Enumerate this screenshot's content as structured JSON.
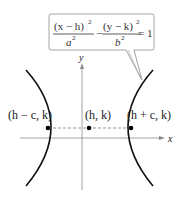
{
  "diagram": {
    "type": "hyperbola",
    "equation": {
      "left_numerator": "(x − h)",
      "left_exp": "2",
      "left_denominator": "a",
      "left_den_exp": "2",
      "operator": "−",
      "right_numerator": "(y − k)",
      "right_exp": "2",
      "right_denominator": "b",
      "right_den_exp": "2",
      "rhs": "= 1"
    },
    "axes": {
      "x_label": "x",
      "y_label": "y"
    },
    "points": [
      {
        "label": "(h − c, k)",
        "role": "left-focus"
      },
      {
        "label": "(h, k)",
        "role": "center"
      },
      {
        "label": "(h + c, k)",
        "role": "right-focus"
      }
    ],
    "colors": {
      "curve": "#111111",
      "axis": "#888888",
      "box_border": "#999999",
      "dashed": "#777777",
      "points": "#000000"
    }
  }
}
